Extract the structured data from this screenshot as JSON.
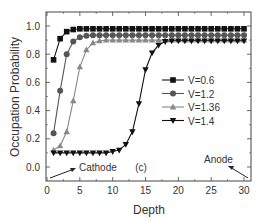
{
  "chart_data": {
    "type": "line",
    "title": "",
    "panel_label": "(c)",
    "xlabel": "Depth",
    "ylabel": "Occupation Probability",
    "xlim": [
      -0.2,
      31
    ],
    "ylim": [
      -0.1,
      1.1
    ],
    "xticks": [
      0,
      5,
      10,
      15,
      20,
      25,
      30
    ],
    "yticks": [
      0.0,
      0.2,
      0.4,
      0.6,
      0.8,
      1.0
    ],
    "ytick_labels": [
      "0.0",
      "0.2",
      "0.4",
      "0.6",
      "0.8",
      "1.0"
    ],
    "grid": false,
    "legend_position": "center-right",
    "x": [
      1,
      2,
      3,
      4,
      5,
      6,
      7,
      8,
      9,
      10,
      11,
      12,
      13,
      14,
      15,
      16,
      17,
      18,
      19,
      20,
      21,
      22,
      23,
      24,
      25,
      26,
      27,
      28,
      29,
      30
    ],
    "series": [
      {
        "name": "V=0.6",
        "marker": "square",
        "color": "#111111",
        "values": [
          0.76,
          0.91,
          0.96,
          0.975,
          0.98,
          0.98,
          0.98,
          0.98,
          0.98,
          0.98,
          0.98,
          0.98,
          0.98,
          0.98,
          0.98,
          0.98,
          0.98,
          0.98,
          0.98,
          0.98,
          0.98,
          0.98,
          0.98,
          0.98,
          0.98,
          0.98,
          0.98,
          0.98,
          0.98,
          0.98
        ]
      },
      {
        "name": "V=1.2",
        "marker": "circle",
        "color": "#555555",
        "values": [
          0.24,
          0.54,
          0.8,
          0.89,
          0.92,
          0.93,
          0.935,
          0.935,
          0.935,
          0.935,
          0.935,
          0.935,
          0.935,
          0.935,
          0.935,
          0.935,
          0.935,
          0.935,
          0.935,
          0.935,
          0.935,
          0.935,
          0.935,
          0.935,
          0.935,
          0.935,
          0.935,
          0.935,
          0.935,
          0.935
        ]
      },
      {
        "name": "V=1.36",
        "marker": "triangle-up",
        "color": "#888888",
        "values": [
          0.12,
          0.15,
          0.25,
          0.47,
          0.71,
          0.83,
          0.88,
          0.895,
          0.9,
          0.9,
          0.9,
          0.9,
          0.9,
          0.9,
          0.9,
          0.9,
          0.9,
          0.9,
          0.9,
          0.9,
          0.9,
          0.9,
          0.9,
          0.9,
          0.9,
          0.9,
          0.9,
          0.9,
          0.9,
          0.9
        ]
      },
      {
        "name": "V=1.4",
        "marker": "triangle-down",
        "color": "#111111",
        "values": [
          0.1,
          0.1,
          0.1,
          0.1,
          0.1,
          0.1,
          0.1,
          0.1,
          0.1,
          0.11,
          0.12,
          0.16,
          0.25,
          0.45,
          0.69,
          0.81,
          0.865,
          0.89,
          0.895,
          0.895,
          0.895,
          0.895,
          0.895,
          0.895,
          0.895,
          0.895,
          0.895,
          0.895,
          0.895,
          0.895
        ]
      }
    ],
    "annotations": [
      {
        "text": "Cathode",
        "x": 5,
        "y": 0.0,
        "arrow_from": [
          0.5,
          -0.08
        ],
        "arrow_to": [
          4.5,
          -0.02
        ]
      },
      {
        "text": "Anode",
        "x": 27.5,
        "y": 0.06,
        "arrow_from": [
          28.2,
          0.02
        ],
        "arrow_to": [
          30.8,
          -0.08
        ]
      }
    ]
  }
}
